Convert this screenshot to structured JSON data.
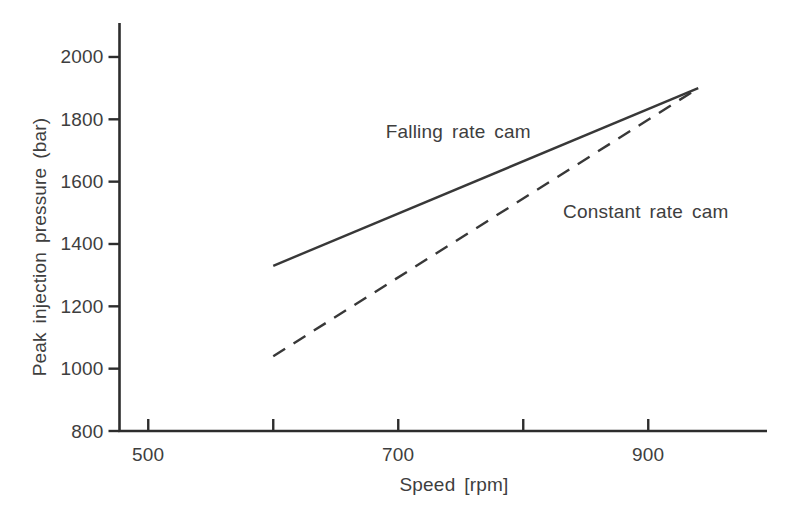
{
  "chart_data": {
    "type": "line",
    "title": "",
    "xlabel": "Speed [rpm]",
    "ylabel": "Peak injection pressure (bar)",
    "xlim": [
      477,
      995
    ],
    "ylim": [
      800,
      2109
    ],
    "grid": false,
    "legend": "inline-annotations",
    "x_ticks": [
      {
        "value": 500,
        "label": "500"
      },
      {
        "value": 600,
        "label": ""
      },
      {
        "value": 700,
        "label": "700"
      },
      {
        "value": 800,
        "label": ""
      },
      {
        "value": 900,
        "label": "900"
      }
    ],
    "y_ticks": [
      {
        "value": 800,
        "label": "800"
      },
      {
        "value": 1000,
        "label": "1000"
      },
      {
        "value": 1200,
        "label": "1200"
      },
      {
        "value": 1400,
        "label": "1400"
      },
      {
        "value": 1600,
        "label": "1600"
      },
      {
        "value": 1800,
        "label": "1800"
      },
      {
        "value": 2000,
        "label": "2000"
      }
    ],
    "series": [
      {
        "name": "Falling rate cam",
        "style": "solid",
        "points": [
          [
            600,
            1330
          ],
          [
            940,
            1900
          ]
        ],
        "label_anchor": {
          "x": 748,
          "y": 1760
        }
      },
      {
        "name": "Constant rate cam",
        "style": "dashed",
        "points": [
          [
            600,
            1040
          ],
          [
            940,
            1900
          ]
        ],
        "label_anchor": {
          "x": 898,
          "y": 1503
        }
      }
    ],
    "colors": {
      "line": "#383838",
      "axis": "#2d2d2d",
      "text": "#3e3e3e",
      "background": "#ffffff"
    }
  }
}
